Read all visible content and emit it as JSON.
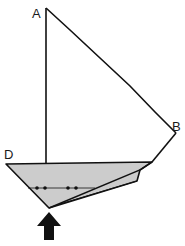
{
  "diagram": {
    "labels": {
      "a": "A",
      "b": "B",
      "d": "D"
    },
    "points": {
      "A": [
        46,
        8
      ],
      "B": [
        176,
        133
      ],
      "D": [
        6,
        164
      ],
      "mast_base": [
        46,
        163
      ],
      "deck_end": [
        152,
        162
      ],
      "keel_tip": [
        49,
        208
      ],
      "hull_inner_1": [
        140,
        170
      ],
      "hull_inner_2": [
        137,
        181
      ]
    },
    "dotted_line": {
      "y": 188,
      "x_start": 28,
      "x_end": 95,
      "dots_x": [
        37,
        45,
        68,
        76
      ]
    },
    "arrow": {
      "direction": "up",
      "tip": [
        49,
        212
      ],
      "base_y": 240
    },
    "colors": {
      "stroke": "#111111",
      "hull_fill": "#cccccc",
      "background": "#ffffff",
      "arrow": "#111111"
    }
  }
}
